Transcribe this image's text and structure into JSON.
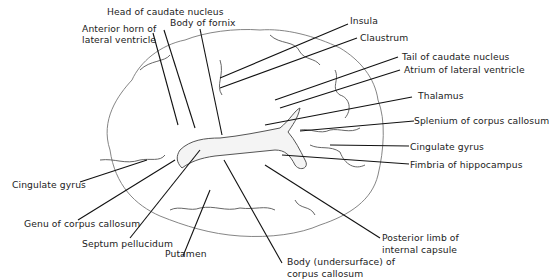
{
  "figure": {
    "type": "anatomical-illustration"
  },
  "labels": {
    "head_of_caudate": "Head of caudate nucleus",
    "anterior_horn_1": "Anterior horn of",
    "anterior_horn_2": "lateral ventricle",
    "body_of_fornix": "Body of fornix",
    "insula": "Insula",
    "claustrum": "Claustrum",
    "tail_of_caudate": "Tail of caudate nucleus",
    "atrium": "Atrium of lateral ventricle",
    "thalamus": "Thalamus",
    "splenium": "Splenium of corpus callosum",
    "cingulate_right": "Cingulate gyrus",
    "fimbria": "Fimbria of hippocampus",
    "cingulate_left": "Cingulate gyrus",
    "genu": "Genu of corpus callosum",
    "septum": "Septum pellucidum",
    "putamen": "Putamen",
    "posterior_limb_1": "Posterior limb of",
    "posterior_limb_2": "internal capsule",
    "body_cc_1": "Body (undersurface) of",
    "body_cc_2": "corpus callosum"
  }
}
